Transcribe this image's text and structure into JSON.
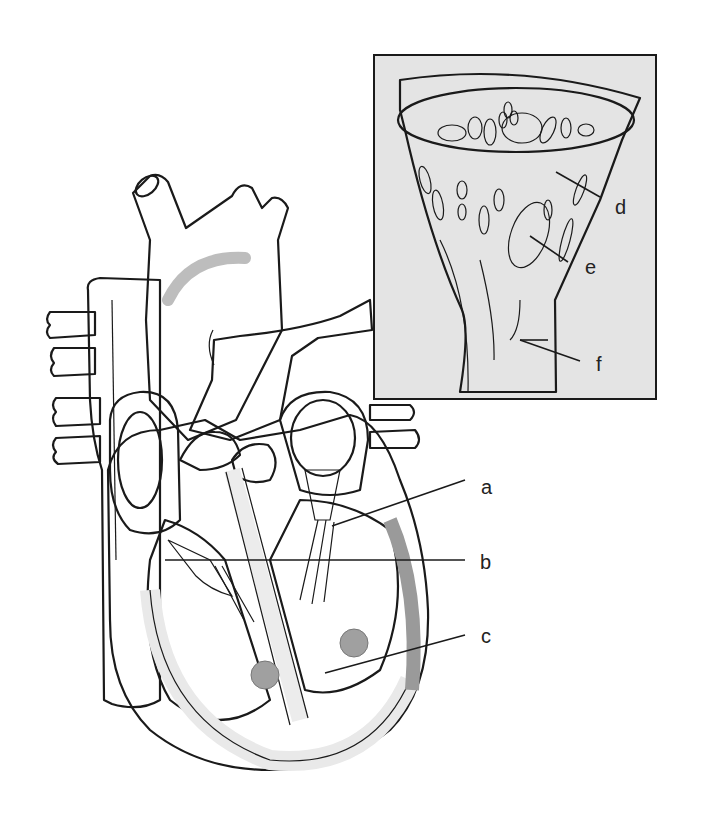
{
  "figure": {
    "labels": [
      {
        "id": "a",
        "text": "a",
        "x": 487,
        "y": 486
      },
      {
        "id": "b",
        "text": "b",
        "x": 483,
        "y": 563
      },
      {
        "id": "c",
        "text": "c",
        "x": 484,
        "y": 637
      },
      {
        "id": "d",
        "text": "d",
        "x": 619,
        "y": 210
      },
      {
        "id": "e",
        "text": "e",
        "x": 588,
        "y": 270
      },
      {
        "id": "f",
        "text": "f",
        "x": 596,
        "y": 368
      }
    ],
    "leader_lines": [
      {
        "id": "a",
        "x1": 465,
        "y1": 480,
        "x2": 332,
        "y2": 526
      },
      {
        "id": "b",
        "x1": 465,
        "y1": 560,
        "x2": 165,
        "y2": 560
      },
      {
        "id": "c",
        "x1": 465,
        "y1": 635,
        "x2": 325,
        "y2": 673
      },
      {
        "id": "d",
        "x1": 600,
        "y1": 197,
        "x2": 556,
        "y2": 172
      },
      {
        "id": "e",
        "x1": 568,
        "y1": 262,
        "x2": 530,
        "y2": 236
      },
      {
        "id": "f",
        "x1": 580,
        "y1": 361,
        "x2": 520,
        "y2": 340
      }
    ],
    "colors": {
      "background": "#ffffff",
      "inset_fill": "#e4e4e4",
      "dark_vessel": "#8c8c8c",
      "mid_gray": "#a8a8a8",
      "light_gray": "#cfcfcf",
      "ink": "#1a1a1a"
    }
  }
}
